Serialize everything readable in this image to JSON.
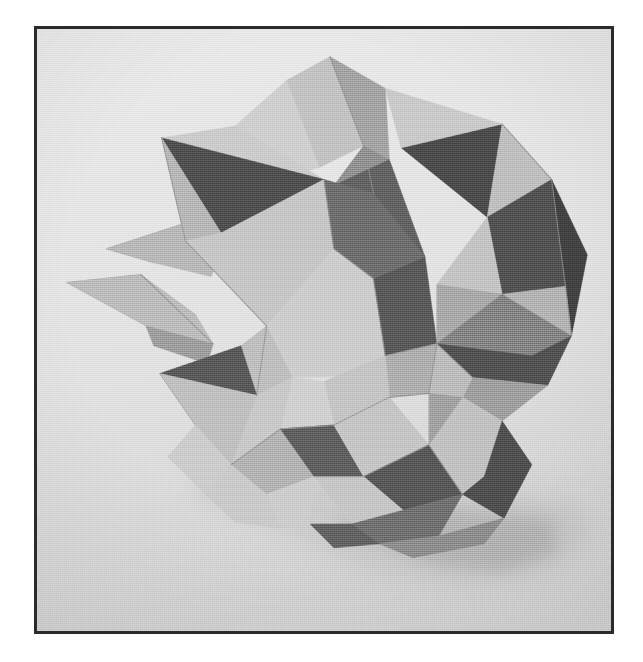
{
  "page": {
    "width": 643,
    "height": 662,
    "background_color": "#ffffff",
    "caption": "",
    "alt_text": "Black and white photograph of a modular origami polyhedron"
  },
  "frame": {
    "x": 34,
    "y": 26,
    "width": 580,
    "height": 608,
    "border_color": "#2b2b2b",
    "border_width": 3
  },
  "photo": {
    "subject": "modular-origami-stellated-polyhedron",
    "description": "Paper model of a compound stellated polyhedron folded from light and dark grey paper, photographed in black and white against a plain pale grey backdrop",
    "background_color": "#e4e4e4",
    "backdrop_gradient_top": "#e7e7e7",
    "backdrop_gradient_bottom": "#d4d4d4",
    "shadow_color": "#a8a8a8",
    "palette": {
      "paper_white": "#d8d8d8",
      "paper_light": "#c6c6c6",
      "paper_mid_light": "#b2b2b2",
      "paper_mid": "#9d9d9d",
      "paper_mid_dark": "#858585",
      "paper_dark": "#5a5a5a",
      "paper_darkest": "#3f3f3f",
      "crease_line": "#7a7a7a",
      "highlight": "#e2e2e2"
    },
    "geometry": {
      "viewbox": "0 0 580 608",
      "shadow": [
        {
          "name": "ground-shadow",
          "points": "150,470 230,500 330,545 430,560 515,548 560,512 545,480 470,468 360,455 250,445 175,450",
          "fill": "#bdbdbd",
          "opacity": 0.55,
          "blur": 14
        },
        {
          "name": "ground-shadow-dark",
          "points": "300,500 400,540 470,548 525,528 520,496 430,486 350,480",
          "fill": "#a6a6a6",
          "opacity": 0.6,
          "blur": 10
        }
      ],
      "facets": [
        {
          "name": "spike-left-upper",
          "points": "70,222 150,196 178,208 118,236",
          "fill": "#8e8e8e"
        },
        {
          "name": "spike-left-lower",
          "points": "70,222 118,236 176,250 182,236 150,196",
          "fill": "#b5b5b5"
        },
        {
          "name": "spike-left-tip",
          "points": "30,256 105,248 150,292 120,305",
          "fill": "#8a8a8a"
        },
        {
          "name": "spike-left-tip-light",
          "points": "30,256 120,305 178,318 160,288 105,248",
          "fill": "#b9b9b9"
        },
        {
          "name": "spike-left-shadow",
          "points": "110,300 178,318 172,338 118,320",
          "fill": "#9a9a9a"
        },
        {
          "name": "top-spike-left-face",
          "points": "252,52 296,28 330,118 285,140",
          "fill": "#c0c0c0"
        },
        {
          "name": "top-spike-right-face",
          "points": "296,28 352,60 356,132 330,118",
          "fill": "#a0a0a0"
        },
        {
          "name": "top-spike-inner",
          "points": "330,118 356,132 340,166 300,158",
          "fill": "#8d8d8d"
        },
        {
          "name": "top-spike-back-left",
          "points": "200,98 252,52 285,140 248,150",
          "fill": "#cdcdcd"
        },
        {
          "name": "upper-left-pent-light",
          "points": "126,110 200,98 290,152 240,240 150,214",
          "fill": "#c9c9c9"
        },
        {
          "name": "upper-left-dark-tri",
          "points": "126,110 290,152 186,206",
          "fill": "#4d4d4d"
        },
        {
          "name": "upper-left-mid",
          "points": "126,110 186,206 150,214",
          "fill": "#b4b4b4"
        },
        {
          "name": "upper-left-lower-light",
          "points": "150,214 186,206 290,152 300,222 232,300",
          "fill": "#c4c4c4"
        },
        {
          "name": "center-left-plate",
          "points": "232,300 300,222 370,250 352,350 258,352",
          "fill": "#cbcbcb"
        },
        {
          "name": "center-left-crease",
          "points": "232,300 258,352 222,370 206,320",
          "fill": "#bcbcbc"
        },
        {
          "name": "mid-dark-kite",
          "points": "300,158 356,132 392,230 340,252",
          "fill": "#5f5f5f"
        },
        {
          "name": "mid-dark-kite-2",
          "points": "340,252 392,230 404,318 352,330",
          "fill": "#565656"
        },
        {
          "name": "center-dark-big",
          "points": "290,152 340,166 392,230 340,252 300,222",
          "fill": "#6a6a6a"
        },
        {
          "name": "upper-right-dark-tri",
          "points": "368,120 470,96 455,190",
          "fill": "#4a4a4a"
        },
        {
          "name": "upper-right-light",
          "points": "352,60 470,96 368,120",
          "fill": "#c7c7c7"
        },
        {
          "name": "upper-right-light-2",
          "points": "470,96 520,152 455,190",
          "fill": "#bcbcbc"
        },
        {
          "name": "right-dark-wedge",
          "points": "455,190 520,152 534,260 470,268",
          "fill": "#4f4f4f"
        },
        {
          "name": "right-light-wedge",
          "points": "455,190 470,268 404,258",
          "fill": "#c1c1c1"
        },
        {
          "name": "right-mid-wedge",
          "points": "404,258 470,268 440,330 404,318",
          "fill": "#a6a6a6"
        },
        {
          "name": "right-far-dark",
          "points": "520,152 556,228 540,310 534,260",
          "fill": "#3f3f3f"
        },
        {
          "name": "right-far-light",
          "points": "534,260 540,310 470,268",
          "fill": "#b0b0b0"
        },
        {
          "name": "star-arm-upper-right",
          "points": "404,318 470,268 540,310 500,330",
          "fill": "#7f7f7f"
        },
        {
          "name": "star-arm-right-dark",
          "points": "404,318 500,330 540,310 516,360 440,352",
          "fill": "#505050"
        },
        {
          "name": "star-point-right",
          "points": "440,352 516,360 470,396 430,372",
          "fill": "#9b9b9b"
        },
        {
          "name": "star-arm-lower-right",
          "points": "404,318 440,352 430,372 396,368",
          "fill": "#b9b9b9"
        },
        {
          "name": "center-star-hub-a",
          "points": "352,330 404,318 396,368 356,372",
          "fill": "#ababab"
        },
        {
          "name": "center-star-hub-b",
          "points": "352,330 356,372 300,400 290,356",
          "fill": "#c2c2c2"
        },
        {
          "name": "center-star-hub-c",
          "points": "290,356 300,400 246,404 258,352",
          "fill": "#cecece"
        },
        {
          "name": "lower-left-light-a",
          "points": "222,370 258,352 246,404 196,440",
          "fill": "#c6c6c6"
        },
        {
          "name": "lower-left-dark-a",
          "points": "124,348 206,320 222,370 160,400",
          "fill": "#575757"
        },
        {
          "name": "lower-left-light-b",
          "points": "124,348 160,400 196,440 222,370",
          "fill": "#bdbdbd"
        },
        {
          "name": "lower-left-light-c",
          "points": "160,400 196,440 170,470 132,432",
          "fill": "#cacaca"
        },
        {
          "name": "lower-left-mid",
          "points": "196,440 246,404 280,452 232,470",
          "fill": "#b0b0b0"
        },
        {
          "name": "bottom-center-dark",
          "points": "246,404 300,400 330,452 280,452",
          "fill": "#5c5c5c"
        },
        {
          "name": "bottom-center-light",
          "points": "300,400 356,372 396,420 330,452",
          "fill": "#c3c3c3"
        },
        {
          "name": "bottom-mid-dark",
          "points": "330,452 396,420 430,470 370,486",
          "fill": "#555555"
        },
        {
          "name": "bottom-right-light",
          "points": "396,420 430,372 470,396 452,452 430,470",
          "fill": "#bfbfbf"
        },
        {
          "name": "bottom-right-dark",
          "points": "430,470 452,452 470,396 500,440 472,494",
          "fill": "#4e4e4e"
        },
        {
          "name": "bottom-right-mid",
          "points": "396,368 430,372 396,420",
          "fill": "#9e9e9e"
        },
        {
          "name": "bottom-tail-light",
          "points": "280,452 330,452 370,486 318,500",
          "fill": "#c4c4c4"
        },
        {
          "name": "bottom-tail-dark",
          "points": "318,500 370,486 430,470 406,512 346,520",
          "fill": "#6d6d6d"
        },
        {
          "name": "bottom-tail-shadow",
          "points": "346,520 406,512 472,494 452,520 380,534",
          "fill": "#8b8b8b"
        },
        {
          "name": "bottom-flap-dark",
          "points": "318,500 346,520 300,524 276,500",
          "fill": "#5f5f5f"
        },
        {
          "name": "bottom-flap-light",
          "points": "232,470 280,452 276,500 246,504",
          "fill": "#cbcbcb"
        },
        {
          "name": "lower-left-tail",
          "points": "170,470 196,440 232,470 246,504 200,498",
          "fill": "#c8c8c8"
        }
      ],
      "creases": [
        {
          "name": "crease-top-spike-ridge",
          "points": "296,28 330,118 340,166"
        },
        {
          "name": "crease-left-long",
          "points": "126,110 150,214 232,300 222,370"
        },
        {
          "name": "crease-center-vertical",
          "points": "290,152 300,222 340,252 352,330"
        },
        {
          "name": "crease-star-hub-radial-1",
          "points": "404,318 352,330"
        },
        {
          "name": "crease-star-hub-radial-2",
          "points": "404,318 470,268"
        },
        {
          "name": "crease-star-hub-radial-3",
          "points": "404,318 440,352"
        },
        {
          "name": "crease-star-hub-radial-4",
          "points": "404,318 396,368"
        },
        {
          "name": "crease-right-ridge",
          "points": "470,96 520,152 534,260 540,310"
        },
        {
          "name": "crease-bottom-ridge",
          "points": "246,404 300,400 356,372 396,368"
        },
        {
          "name": "crease-bottom-tail",
          "points": "280,452 330,452 396,420 430,470"
        },
        {
          "name": "crease-lower-left",
          "points": "196,440 246,404 300,400"
        },
        {
          "name": "crease-spike-left",
          "points": "105,248 178,318"
        }
      ]
    }
  }
}
